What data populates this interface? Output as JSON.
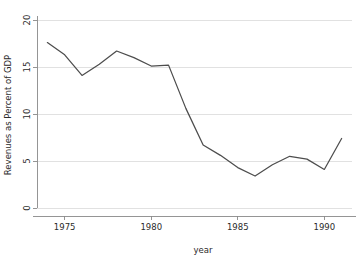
{
  "chart_data": {
    "type": "line",
    "title": "",
    "xlabel": "year",
    "ylabel": "Revenues as Percent of GDP",
    "xlim": [
      1973.4,
      1991.6
    ],
    "ylim": [
      0,
      20
    ],
    "xticks": [
      1975,
      1980,
      1985,
      1990
    ],
    "xtick_labels": [
      "1975",
      "1980",
      "1985",
      "1990"
    ],
    "yticks": [
      0,
      5,
      10,
      15,
      20
    ],
    "ytick_labels": [
      "0",
      "5",
      "10",
      "15",
      "20"
    ],
    "grid": true,
    "grid_axis": "y",
    "legend": false,
    "legend_position": "none",
    "x": [
      1974,
      1975,
      1976,
      1977,
      1978,
      1979,
      1980,
      1981,
      1982,
      1983,
      1984,
      1985,
      1986,
      1987,
      1988,
      1989,
      1990,
      1991
    ],
    "values": [
      17.6,
      16.3,
      14.1,
      15.3,
      16.7,
      16.0,
      15.1,
      15.2,
      10.6,
      6.7,
      5.6,
      4.3,
      3.4,
      4.6,
      5.5,
      5.2,
      4.1,
      7.4
    ],
    "series": [
      {
        "name": "Revenues as Percent of GDP",
        "color": "#4d4d4d",
        "values": [
          17.6,
          16.3,
          14.1,
          15.3,
          16.7,
          16.0,
          15.1,
          15.2,
          10.6,
          6.7,
          5.6,
          4.3,
          3.4,
          4.6,
          5.5,
          5.2,
          4.1,
          7.4
        ]
      }
    ],
    "colors": {
      "line": "#4d4d4d",
      "grid": "#d9d9d9",
      "axis": "#8a8a8a",
      "text": "#2b2b2b",
      "background": "#ffffff"
    }
  }
}
